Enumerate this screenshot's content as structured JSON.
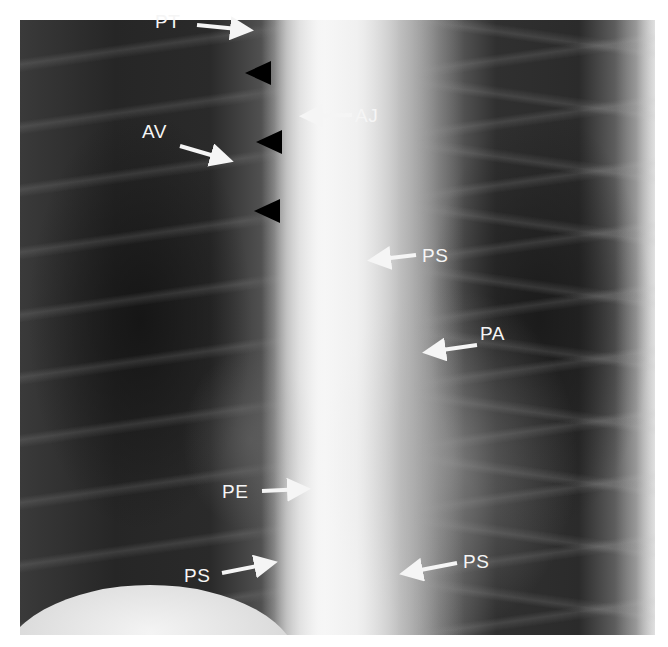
{
  "figure": {
    "background": "#ffffff",
    "labels": [
      {
        "id": "pt",
        "text": "PT",
        "x": 155,
        "y": 12
      },
      {
        "id": "aj",
        "text": "AJ",
        "x": 355,
        "y": 106
      },
      {
        "id": "av",
        "text": "AV",
        "x": 142,
        "y": 122
      },
      {
        "id": "ps-upper",
        "text": "PS",
        "x": 422,
        "y": 246
      },
      {
        "id": "pa",
        "text": "PA",
        "x": 480,
        "y": 324
      },
      {
        "id": "pe",
        "text": "PE",
        "x": 222,
        "y": 482
      },
      {
        "id": "ps-lower-left",
        "text": "PS",
        "x": 184,
        "y": 566
      },
      {
        "id": "ps-lower-right",
        "text": "PS",
        "x": 463,
        "y": 552
      }
    ],
    "arrows": [
      {
        "id": "arrow-pt",
        "direction": "right",
        "x1": 197,
        "y1": 25,
        "x2": 248,
        "y2": 30
      },
      {
        "id": "arrow-aj",
        "direction": "left",
        "x1": 352,
        "y1": 115,
        "x2": 305,
        "y2": 116
      },
      {
        "id": "arrow-av",
        "direction": "right",
        "x1": 180,
        "y1": 146,
        "x2": 228,
        "y2": 160
      },
      {
        "id": "arrow-ps-upper",
        "direction": "left",
        "x1": 416,
        "y1": 255,
        "x2": 373,
        "y2": 260
      },
      {
        "id": "arrow-pa",
        "direction": "left",
        "x1": 477,
        "y1": 345,
        "x2": 428,
        "y2": 352
      },
      {
        "id": "arrow-pe",
        "direction": "right",
        "x1": 262,
        "y1": 491,
        "x2": 305,
        "y2": 489
      },
      {
        "id": "arrow-ps-lower-left",
        "direction": "right",
        "x1": 222,
        "y1": 573,
        "x2": 272,
        "y2": 563
      },
      {
        "id": "arrow-ps-lower-right",
        "direction": "left",
        "x1": 457,
        "y1": 563,
        "x2": 405,
        "y2": 573
      }
    ],
    "arrowheads": [
      {
        "id": "arrowhead-1",
        "direction": "left",
        "x": 245,
        "y": 73
      },
      {
        "id": "arrowhead-2",
        "direction": "left",
        "x": 256,
        "y": 142
      },
      {
        "id": "arrowhead-3",
        "direction": "left",
        "x": 254,
        "y": 211
      }
    ],
    "colors": {
      "annotation": "#f5f5f5",
      "arrowhead": "#000000"
    }
  }
}
